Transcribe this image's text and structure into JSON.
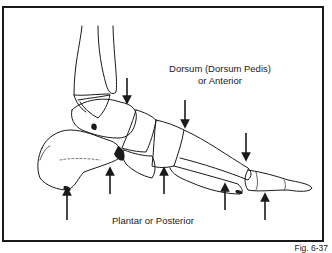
{
  "figure": {
    "dorsal_label_line1": "Dorsum (Dorsum Pedis)",
    "dorsal_label_line2": "or Anterior",
    "plantar_label": "Plantar or Posterior",
    "figure_number": "Fig. 6-37"
  },
  "arrows": {
    "dorsal": [
      {
        "x": 127,
        "y1": 78,
        "y2": 103
      },
      {
        "x": 185,
        "y1": 100,
        "y2": 127
      },
      {
        "x": 246,
        "y1": 133,
        "y2": 160
      }
    ],
    "plantar": [
      {
        "x": 67,
        "y1": 220,
        "y2": 188
      },
      {
        "x": 110,
        "y1": 194,
        "y2": 168
      },
      {
        "x": 164,
        "y1": 194,
        "y2": 168
      },
      {
        "x": 225,
        "y1": 210,
        "y2": 184
      },
      {
        "x": 265,
        "y1": 220,
        "y2": 194
      }
    ]
  },
  "colors": {
    "ink": "#1a1a1a",
    "background": "#ffffff"
  }
}
